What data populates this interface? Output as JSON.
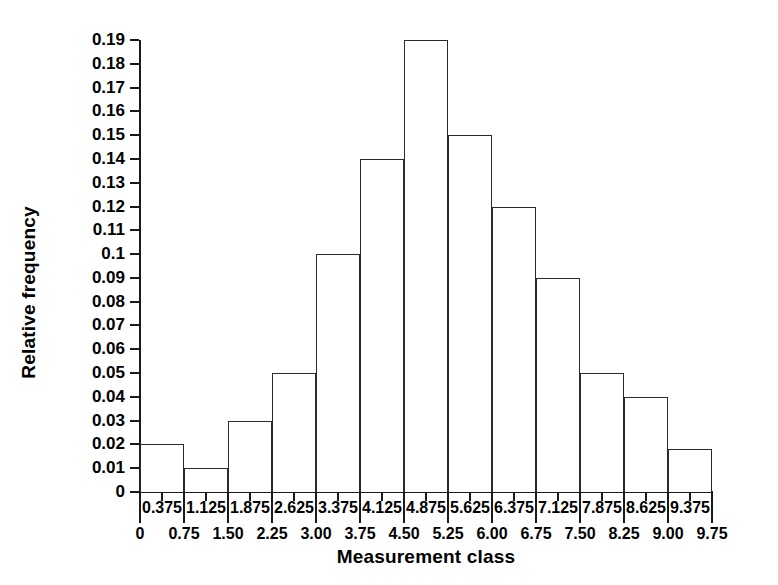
{
  "chart_data": {
    "type": "bar",
    "title": "",
    "xlabel": "Measurement class",
    "ylabel": "Relative frequency",
    "categories": [
      "0.375",
      "1.125",
      "1.875",
      "2.625",
      "3.375",
      "4.125",
      "4.875",
      "5.625",
      "6.375",
      "7.125",
      "7.875",
      "8.625",
      "9.375"
    ],
    "values": [
      0.02,
      0.01,
      0.03,
      0.05,
      0.1,
      0.14,
      0.19,
      0.15,
      0.12,
      0.09,
      0.05,
      0.04,
      0.018
    ],
    "bin_boundaries": [
      "0",
      "0.75",
      "1.50",
      "2.25",
      "3.00",
      "3.75",
      "4.50",
      "5.25",
      "6.00",
      "6.75",
      "7.50",
      "8.25",
      "9.00",
      "9.75"
    ],
    "ylim": [
      0,
      0.19
    ],
    "xlim": [
      0,
      9.75
    ],
    "ytick_labels": [
      "0.19",
      "0.18",
      "0.17",
      "0.16",
      "0.15",
      "0.14",
      "0.13",
      "0.12",
      "0.11",
      "0.1",
      "0.09",
      "0.08",
      "0.07",
      "0.06",
      "0.05",
      "0.04",
      "0.03",
      "0.02",
      "0.01",
      "0"
    ],
    "ytick_values": [
      0.19,
      0.18,
      0.17,
      0.16,
      0.15,
      0.14,
      0.13,
      0.12,
      0.11,
      0.1,
      0.09,
      0.08,
      0.07,
      0.06,
      0.05,
      0.04,
      0.03,
      0.02,
      0.01,
      0
    ],
    "grid": false,
    "legend": null,
    "bar_fill": "#ffffff",
    "bar_stroke": "#2b2b2b",
    "axis_color": "#1a1a1a",
    "background": "#ffffff"
  }
}
